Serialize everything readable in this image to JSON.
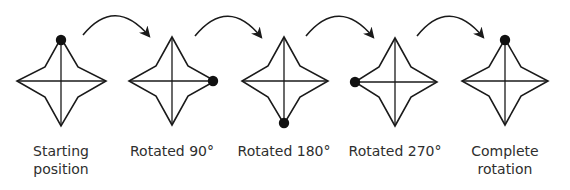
{
  "diagram": {
    "colors": {
      "stroke": "#1a1a1a",
      "marker": "#111111",
      "text": "#2e2e2e"
    },
    "stages": [
      {
        "label_line1": "Starting",
        "label_line2": "position",
        "marker_vertex": "top",
        "rotation_deg": 0,
        "cx": 61
      },
      {
        "label_line1": "Rotated 90°",
        "label_line2": "",
        "marker_vertex": "right",
        "rotation_deg": 90,
        "cx": 172
      },
      {
        "label_line1": "Rotated 180°",
        "label_line2": "",
        "marker_vertex": "bottom",
        "rotation_deg": 180,
        "cx": 284
      },
      {
        "label_line1": "Rotated 270°",
        "label_line2": "",
        "marker_vertex": "left",
        "rotation_deg": 270,
        "cx": 395
      },
      {
        "label_line1": "Complete",
        "label_line2": "rotation",
        "marker_vertex": "top",
        "rotation_deg": 360,
        "cx": 505
      }
    ],
    "arrows": [
      {
        "from": 0,
        "to": 1,
        "icon": "curved-arrow-clockwise"
      },
      {
        "from": 1,
        "to": 2,
        "icon": "curved-arrow-clockwise"
      },
      {
        "from": 2,
        "to": 3,
        "icon": "curved-arrow-clockwise"
      },
      {
        "from": 3,
        "to": 4,
        "icon": "curved-arrow-clockwise"
      }
    ]
  }
}
